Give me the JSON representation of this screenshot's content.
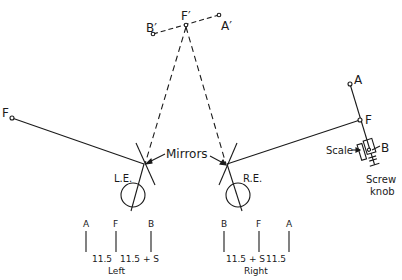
{
  "diagram": {
    "type": "optical-setup",
    "stroke_color": "#1a1a1a",
    "background": "#ffffff",
    "virtual_points": {
      "b_prime": "B′",
      "f_prime": "F′",
      "a_prime": "A′"
    },
    "left_target": {
      "f_label": "F"
    },
    "right_apparatus": {
      "a_label": "A",
      "f_label": "F",
      "b_label": "B",
      "scale_label": "Scale",
      "screw_label_line1": "Screw",
      "screw_label_line2": "knob"
    },
    "mirrors_label": "Mirrors",
    "eyes": {
      "left": "L.E.",
      "right": "R.E."
    },
    "left_scale": {
      "marks": [
        "A",
        "F",
        "B"
      ],
      "gap1": "11.5",
      "gap2": "11.5 + S",
      "caption": "Left"
    },
    "right_scale": {
      "marks": [
        "B",
        "F",
        "A"
      ],
      "gap1": "11.5 + S",
      "gap2": "11.5",
      "caption": "Right"
    }
  }
}
